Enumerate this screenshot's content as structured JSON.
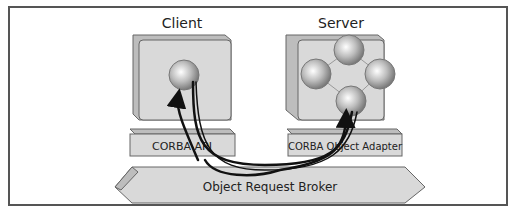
{
  "diagram": {
    "client": {
      "title": "Client",
      "api_label": "CORBA API"
    },
    "server": {
      "title": "Server",
      "adapter_label": "CORBA Object Adapter"
    },
    "orb": {
      "label": "Object Request Broker"
    },
    "colors": {
      "box": "#d9d9d9",
      "box_side": "#bdbdbd",
      "border": "#555555",
      "arrow": "#111111"
    }
  }
}
